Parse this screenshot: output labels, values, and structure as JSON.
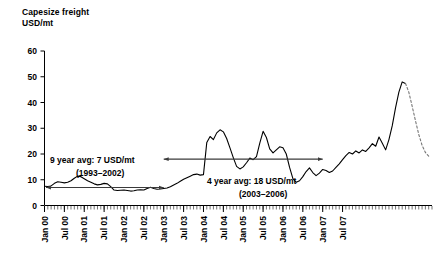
{
  "chart_data": {
    "type": "line",
    "title": "Capesize freight",
    "subtitle": "USD/mt",
    "ylabel": "USD/mt",
    "xlabel": "",
    "ylim": [
      0,
      60
    ],
    "yticks": [
      0,
      10,
      20,
      30,
      40,
      50,
      60
    ],
    "grid": false,
    "legend": "none",
    "x_tick_labels": [
      "Jan 00",
      "Jul 00",
      "Jan 01",
      "Jul 01",
      "Jan 02",
      "Jul 02",
      "Jan 03",
      "Jul 03",
      "Jan 04",
      "Jul 04",
      "Jan 05",
      "Jul 05",
      "Jan 06",
      "Jul 06",
      "Jan 07",
      "Jul 07"
    ],
    "x_tick_indices": [
      0,
      6,
      12,
      18,
      24,
      30,
      36,
      42,
      48,
      54,
      60,
      66,
      72,
      78,
      84,
      90
    ],
    "x_minor_tick_interval_months": 1,
    "x_start": "Jan 00",
    "x_end": "Mar 08",
    "series": [
      {
        "name": "Capesize freight rate",
        "style": "solid",
        "color": "#000000",
        "values": [
          7.5,
          7.4,
          7.6,
          8.6,
          9.2,
          9.0,
          8.8,
          9.0,
          9.6,
          10.6,
          11.4,
          11.2,
          10.4,
          9.6,
          9.0,
          8.4,
          8.0,
          8.2,
          8.6,
          8.4,
          7.3,
          6.0,
          5.8,
          5.9,
          6.0,
          5.8,
          5.6,
          5.7,
          6.0,
          6.1,
          6.0,
          6.6,
          7.1,
          6.6,
          6.3,
          6.4,
          6.6,
          6.8,
          7.3,
          8.0,
          8.6,
          9.4,
          10.2,
          10.8,
          11.4,
          12.0,
          12.2,
          11.8,
          12.0,
          24.5,
          26.8,
          25.6,
          28.2,
          29.4,
          28.6,
          26.0,
          22.4,
          18.6,
          15.2,
          14.2,
          15.0,
          16.6,
          18.4,
          17.8,
          19.0,
          24.2,
          28.8,
          26.4,
          22.0,
          20.4,
          21.6,
          22.8,
          22.4,
          20.0,
          14.8,
          10.4,
          9.0,
          9.6,
          11.2,
          13.2,
          14.6,
          12.8,
          11.6,
          12.6,
          14.0,
          13.6,
          12.8,
          13.4,
          14.8,
          16.2,
          17.8,
          19.4,
          20.6,
          20.0,
          21.2,
          20.4,
          21.6,
          21.0,
          22.4,
          24.0,
          23.0,
          26.6,
          24.2,
          21.6,
          25.6,
          31.0,
          38.0,
          44.0,
          48.0,
          47.4
        ]
      },
      {
        "name": "Forecast",
        "style": "dashed",
        "color": "#6b6b6b",
        "values": [
          47.4,
          44.0,
          38.6,
          33.0,
          27.6,
          23.4,
          20.6,
          19.2
        ]
      }
    ],
    "annotations": [
      {
        "id": "avg-9-year",
        "label_line1": "9 year avg: 7 USD/mt",
        "label_line2": "(1993–2002)",
        "value": 7,
        "unit": "USD/mt",
        "period": "1993–2002",
        "arrow": "double",
        "x_from": "Jan 00",
        "x_to": "Jan 03"
      },
      {
        "id": "avg-4-year",
        "label_line1": "4 year avg: 18 USD/mt",
        "label_line2": "(2003–2006)",
        "value": 18,
        "unit": "USD/mt",
        "period": "2003–2006",
        "arrow": "double",
        "x_from": "Jan 03",
        "x_to": "Jan 07"
      }
    ]
  }
}
